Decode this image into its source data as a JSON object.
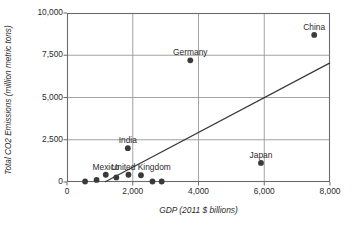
{
  "chart_data": {
    "type": "scatter",
    "title": "",
    "xlabel": "GDP (2011 $ billions)",
    "ylabel": "Total CO2 Emissions (million metric tons)",
    "xlim": [
      0,
      8000
    ],
    "ylim": [
      0,
      10000
    ],
    "grid": true,
    "legend": "none",
    "x_ticks": [
      "0",
      "2,000",
      "4,000",
      "6,000",
      "8,000"
    ],
    "x_tick_values": [
      0,
      2000,
      4000,
      6000,
      8000
    ],
    "y_ticks": [
      "0",
      "2,500",
      "5,000",
      "7,500",
      "10,000"
    ],
    "y_tick_values": [
      0,
      2500,
      5000,
      7500,
      10000
    ],
    "points": [
      {
        "label": "",
        "x": 550,
        "y": 30
      },
      {
        "label": "",
        "x": 900,
        "y": 120
      },
      {
        "label": "Mexico",
        "x": 1180,
        "y": 430
      },
      {
        "label": "",
        "x": 1500,
        "y": 270
      },
      {
        "label": "India",
        "x": 1850,
        "y": 2000
      },
      {
        "label": "",
        "x": 1870,
        "y": 430
      },
      {
        "label": "United Kingdom",
        "x": 2250,
        "y": 400
      },
      {
        "label": "",
        "x": 2600,
        "y": 30
      },
      {
        "label": "",
        "x": 2880,
        "y": 30
      },
      {
        "label": "Germany",
        "x": 3750,
        "y": 7200
      },
      {
        "label": "Japan",
        "x": 5900,
        "y": 1130
      },
      {
        "label": "China",
        "x": 7520,
        "y": 8700
      }
    ],
    "trendline": {
      "name": "linear trend",
      "x_start": 1150,
      "y_start": 0,
      "x_end": 8000,
      "y_end": 7050
    },
    "colors": {
      "marker": "#3a3a3a",
      "trendline": "#3a3a3a",
      "grid": "#999999",
      "axis": "#6b6b6b",
      "text": "#2b2b2b",
      "background": "#ffffff"
    }
  }
}
